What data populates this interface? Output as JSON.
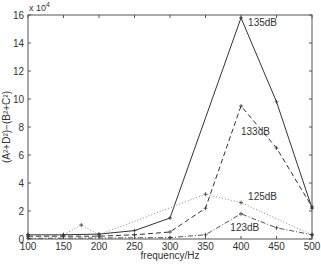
{
  "chart_data": {
    "type": "line",
    "title": "",
    "xlabel": "frequency/Hz",
    "ylabel": "(A²+D²)−(B²+C²)",
    "y_multiplier": "x 10^4",
    "xlim": [
      100,
      500
    ],
    "ylim": [
      0,
      16
    ],
    "xticks": [
      100,
      150,
      200,
      250,
      300,
      350,
      400,
      450,
      500
    ],
    "yticks": [
      0,
      2,
      4,
      6,
      8,
      10,
      12,
      14,
      16
    ],
    "grid": false,
    "series": [
      {
        "name": "135dB",
        "style": "solid",
        "x": [
          100,
          150,
          200,
          250,
          300,
          400,
          450,
          500
        ],
        "y": [
          0.3,
          0.3,
          0.35,
          0.6,
          1.5,
          15.8,
          9.8,
          2.2
        ],
        "label_pos": [
          410,
          15.2
        ]
      },
      {
        "name": "133dB",
        "style": "dashed",
        "x": [
          100,
          150,
          200,
          250,
          300,
          350,
          400,
          450,
          500
        ],
        "y": [
          0.2,
          0.2,
          0.2,
          0.3,
          0.5,
          2.2,
          9.5,
          6.5,
          2.3
        ],
        "label_pos": [
          400,
          7.4
        ]
      },
      {
        "name": "125dB",
        "style": "dotted",
        "x": [
          100,
          150,
          175,
          200,
          350,
          400,
          500
        ],
        "y": [
          0.3,
          0.3,
          1.0,
          0.3,
          3.2,
          2.6,
          0.3
        ],
        "label_pos": [
          410,
          2.8
        ]
      },
      {
        "name": "123dB",
        "style": "dashdot",
        "x": [
          100,
          300,
          350,
          400,
          450,
          500
        ],
        "y": [
          0.05,
          0.1,
          0.3,
          1.8,
          0.8,
          0.3
        ],
        "label_pos": [
          385,
          0.6
        ]
      }
    ]
  }
}
